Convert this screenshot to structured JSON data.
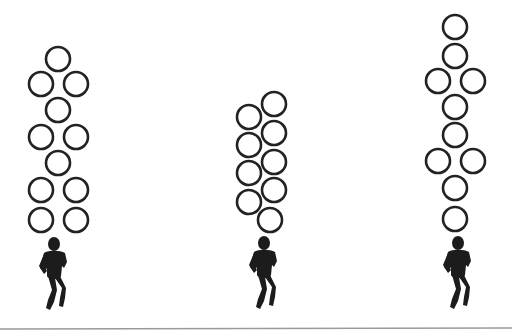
{
  "diagram": {
    "colors": {
      "ring": "#222222",
      "runner": "#1c1c1c",
      "baseline": "#9a9a9a",
      "background": "#ffffff"
    },
    "ring_radius": 12,
    "formations": [
      {
        "name": "left",
        "rings": [
          [
            58,
            59
          ],
          [
            41,
            84
          ],
          [
            76,
            84
          ],
          [
            58,
            110
          ],
          [
            41,
            137
          ],
          [
            76,
            137
          ],
          [
            58,
            163
          ],
          [
            41,
            190
          ],
          [
            76,
            190
          ],
          [
            41,
            220
          ],
          [
            76,
            220
          ]
        ],
        "runner": {
          "x": 54,
          "y": 238
        }
      },
      {
        "name": "middle",
        "rings": [
          [
            274,
            104
          ],
          [
            249,
            117
          ],
          [
            274,
            133
          ],
          [
            249,
            145
          ],
          [
            274,
            162
          ],
          [
            249,
            173
          ],
          [
            274,
            190
          ],
          [
            249,
            202
          ],
          [
            270,
            220
          ]
        ],
        "runner": {
          "x": 264,
          "y": 237
        }
      },
      {
        "name": "right",
        "rings": [
          [
            455,
            27
          ],
          [
            455,
            56
          ],
          [
            438,
            81
          ],
          [
            473,
            81
          ],
          [
            455,
            107
          ],
          [
            455,
            135
          ],
          [
            438,
            161
          ],
          [
            473,
            161
          ],
          [
            455,
            188
          ],
          [
            455,
            219
          ]
        ],
        "runner": {
          "x": 458,
          "y": 237
        }
      }
    ],
    "baseline_y": 329
  }
}
